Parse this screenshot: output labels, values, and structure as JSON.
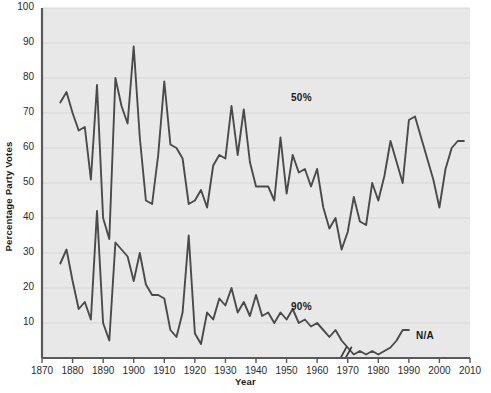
{
  "chart_data": {
    "type": "line",
    "title": "",
    "xlabel": "Year",
    "ylabel": "Percentage Party Votes",
    "xlim": [
      1870,
      2010
    ],
    "ylim": [
      0,
      100
    ],
    "grid": true,
    "legend_position": "inline-annotation",
    "xticks": [
      1870,
      1880,
      1890,
      1900,
      1910,
      1920,
      1930,
      1940,
      1950,
      1960,
      1970,
      1980,
      1990,
      2000,
      2010
    ],
    "yticks": [
      10,
      20,
      30,
      40,
      50,
      60,
      70,
      80,
      90,
      100
    ],
    "annotations": [
      {
        "text": "50%",
        "x": 1940,
        "y": 72
      },
      {
        "text": "90%",
        "x": 1940,
        "y": 13
      },
      {
        "text": "N/A",
        "x": 1981,
        "y": 5
      },
      {
        "text": "axis-break",
        "x": 1970,
        "y": 2
      }
    ],
    "series": [
      {
        "name": "50%",
        "color": "#4a4a4a",
        "x": [
          1876,
          1878,
          1880,
          1882,
          1884,
          1886,
          1888,
          1890,
          1892,
          1894,
          1896,
          1898,
          1900,
          1902,
          1904,
          1906,
          1908,
          1910,
          1912,
          1914,
          1916,
          1918,
          1920,
          1922,
          1924,
          1926,
          1928,
          1930,
          1932,
          1934,
          1936,
          1938,
          1940,
          1942,
          1944,
          1946,
          1948,
          1950,
          1952,
          1954,
          1956,
          1958,
          1960,
          1962,
          1964,
          1966,
          1968,
          1970,
          1972,
          1974,
          1976,
          1978,
          1980,
          1982,
          1984,
          1986,
          1988,
          1990,
          1992,
          1994,
          1996,
          1998,
          2000,
          2002,
          2004,
          2006,
          2008
        ],
        "y": [
          73,
          76,
          70,
          65,
          66,
          51,
          78,
          40,
          34,
          80,
          72,
          67,
          89,
          63,
          45,
          44,
          58,
          79,
          61,
          60,
          57,
          44,
          45,
          48,
          43,
          55,
          58,
          57,
          72,
          58,
          71,
          56,
          49,
          49,
          49,
          45,
          63,
          47,
          58,
          53,
          54,
          49,
          54,
          43,
          37,
          40,
          31,
          36,
          46,
          39,
          38,
          50,
          45,
          52,
          62,
          56,
          50,
          68,
          69,
          63,
          57,
          51,
          43,
          54,
          60,
          62,
          62
        ]
      },
      {
        "name": "90%",
        "color": "#4a4a4a",
        "x": [
          1876,
          1878,
          1880,
          1882,
          1884,
          1886,
          1888,
          1890,
          1892,
          1894,
          1896,
          1898,
          1900,
          1902,
          1904,
          1906,
          1908,
          1910,
          1912,
          1914,
          1916,
          1918,
          1920,
          1922,
          1924,
          1926,
          1928,
          1930,
          1932,
          1934,
          1936,
          1938,
          1940,
          1942,
          1944,
          1946,
          1948,
          1950,
          1952,
          1954,
          1956,
          1958,
          1960,
          1962,
          1964,
          1966,
          1968,
          1972,
          1974,
          1976,
          1978,
          1980,
          1982,
          1984,
          1986,
          1988,
          1990
        ],
        "y": [
          27,
          31,
          22,
          14,
          16,
          11,
          42,
          10,
          5,
          33,
          31,
          29,
          22,
          30,
          21,
          18,
          18,
          17,
          8,
          6,
          13,
          35,
          7,
          4,
          13,
          11,
          17,
          15,
          20,
          13,
          16,
          12,
          18,
          12,
          13,
          10,
          13,
          11,
          14,
          10,
          11,
          9,
          10,
          8,
          6,
          8,
          5,
          1,
          2,
          1,
          2,
          1,
          2,
          3,
          5,
          8,
          8
        ]
      }
    ]
  },
  "axes": {
    "y_title": "Percentage Party Votes",
    "x_title": "Year"
  },
  "labels": {
    "fifty": "50%",
    "ninety": "90%",
    "na": "N/A"
  }
}
